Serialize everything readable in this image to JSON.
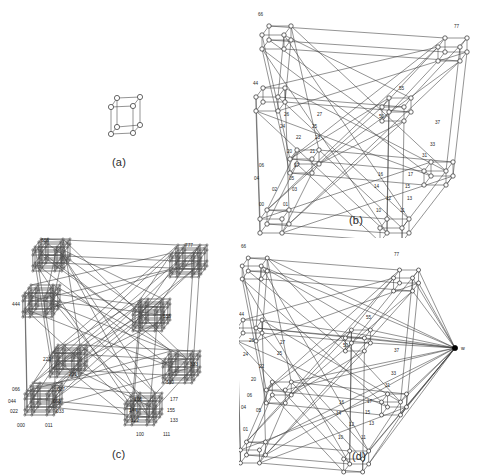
{
  "figure": {
    "kind": "multi-panel-line-drawing",
    "panel_count": 4,
    "background": "#ffffff",
    "ink": "#2a2a2a"
  },
  "captions": {
    "a": "(a)",
    "b": "(b)",
    "c": "(c)",
    "d": "(d)"
  },
  "panels": {
    "a": {
      "name": "panel-a",
      "description": "3-cube (Q3) drawn as a small box with 8 circular nodes",
      "node_count": 8,
      "labels": []
    },
    "b": {
      "name": "panel-b",
      "description": "Large recursive cube-of-cubes graph with 2-digit octal node labels",
      "node_count": 64,
      "labels": [
        "66",
        "77",
        "44",
        "55",
        "50",
        "37",
        "33",
        "31",
        "27",
        "26",
        "25",
        "24",
        "23",
        "22",
        "21",
        "20",
        "17",
        "16",
        "15",
        "14",
        "13",
        "12",
        "11",
        "10",
        "06",
        "05",
        "04",
        "03",
        "02",
        "01",
        "00",
        "07"
      ]
    },
    "c": {
      "name": "panel-c",
      "description": "Cube-of-cubes-of-cubes graph; each corner is a dense cluster, 3-digit octal labels",
      "cluster_count": 8,
      "labels": [
        "666",
        "777",
        "444",
        "555",
        "222",
        "333",
        "066",
        "027",
        "044",
        "055",
        "022",
        "033",
        "000",
        "011",
        "166",
        "177",
        "144",
        "155",
        "122",
        "133",
        "100",
        "111",
        "266",
        "377"
      ]
    },
    "d": {
      "name": "panel-d",
      "description": "Same as panel (b) but with an extra filled apex vertex w joined to many nodes",
      "labels": [
        "66",
        "77",
        "44",
        "55",
        "50",
        "37",
        "33",
        "31",
        "27",
        "26",
        "25",
        "24",
        "22",
        "20",
        "17",
        "16",
        "15",
        "14",
        "13",
        "12",
        "11",
        "10",
        "06",
        "04",
        "03",
        "02",
        "01",
        "00"
      ],
      "apex_label": "w"
    }
  },
  "node_labels": {
    "b": [
      {
        "t": "66",
        "x": 19,
        "y": 16
      },
      {
        "t": "77",
        "x": 215,
        "y": 28
      },
      {
        "t": "44",
        "x": 14,
        "y": 85
      },
      {
        "t": "55",
        "x": 160,
        "y": 90
      },
      {
        "t": "50",
        "x": 140,
        "y": 118
      },
      {
        "t": "37",
        "x": 196,
        "y": 124
      },
      {
        "t": "33",
        "x": 191,
        "y": 146
      },
      {
        "t": "31",
        "x": 183,
        "y": 157
      },
      {
        "t": "26",
        "x": 45,
        "y": 116
      },
      {
        "t": "27",
        "x": 78,
        "y": 116
      },
      {
        "t": "24",
        "x": 41,
        "y": 128
      },
      {
        "t": "25",
        "x": 73,
        "y": 128
      },
      {
        "t": "22",
        "x": 57,
        "y": 139
      },
      {
        "t": "23",
        "x": 76,
        "y": 139
      },
      {
        "t": "20",
        "x": 48,
        "y": 153
      },
      {
        "t": "21",
        "x": 71,
        "y": 153
      },
      {
        "t": "16",
        "x": 139,
        "y": 176
      },
      {
        "t": "17",
        "x": 169,
        "y": 176
      },
      {
        "t": "14",
        "x": 135,
        "y": 188
      },
      {
        "t": "15",
        "x": 166,
        "y": 188
      },
      {
        "t": "12",
        "x": 147,
        "y": 200
      },
      {
        "t": "13",
        "x": 168,
        "y": 200
      },
      {
        "t": "10",
        "x": 137,
        "y": 212
      },
      {
        "t": "11",
        "x": 161,
        "y": 212
      },
      {
        "t": "06",
        "x": 20,
        "y": 167
      },
      {
        "t": "07",
        "x": 55,
        "y": 167
      },
      {
        "t": "04",
        "x": 15,
        "y": 180
      },
      {
        "t": "05",
        "x": 50,
        "y": 180
      },
      {
        "t": "02",
        "x": 33,
        "y": 191
      },
      {
        "t": "03",
        "x": 53,
        "y": 191
      },
      {
        "t": "00",
        "x": 20,
        "y": 206
      },
      {
        "t": "01",
        "x": 44,
        "y": 206
      }
    ],
    "c": [
      {
        "t": "666",
        "x": 41,
        "y": 12
      },
      {
        "t": "777",
        "x": 185,
        "y": 17
      },
      {
        "t": "444",
        "x": 12,
        "y": 76
      },
      {
        "t": "555",
        "x": 163,
        "y": 88
      },
      {
        "t": "222",
        "x": 43,
        "y": 131
      },
      {
        "t": "221",
        "x": 69,
        "y": 146
      },
      {
        "t": "333",
        "x": 190,
        "y": 136
      },
      {
        "t": "330",
        "x": 166,
        "y": 154
      },
      {
        "t": "066",
        "x": 12,
        "y": 161
      },
      {
        "t": "027",
        "x": 57,
        "y": 161
      },
      {
        "t": "044",
        "x": 8,
        "y": 173
      },
      {
        "t": "055",
        "x": 53,
        "y": 173
      },
      {
        "t": "022",
        "x": 10,
        "y": 183
      },
      {
        "t": "033",
        "x": 56,
        "y": 183
      },
      {
        "t": "000",
        "x": 17,
        "y": 197
      },
      {
        "t": "011",
        "x": 45,
        "y": 197
      },
      {
        "t": "166",
        "x": 134,
        "y": 171
      },
      {
        "t": "177",
        "x": 170,
        "y": 171
      },
      {
        "t": "144",
        "x": 129,
        "y": 182
      },
      {
        "t": "155",
        "x": 167,
        "y": 182
      },
      {
        "t": "122",
        "x": 131,
        "y": 192
      },
      {
        "t": "133",
        "x": 170,
        "y": 192
      },
      {
        "t": "100",
        "x": 136,
        "y": 206
      },
      {
        "t": "111",
        "x": 163,
        "y": 206
      }
    ],
    "d": [
      {
        "t": "66",
        "x": 2,
        "y": 18
      },
      {
        "t": "77",
        "x": 155,
        "y": 26
      },
      {
        "t": "44",
        "x": 0,
        "y": 86
      },
      {
        "t": "55",
        "x": 127,
        "y": 89
      },
      {
        "t": "50",
        "x": 104,
        "y": 117
      },
      {
        "t": "37",
        "x": 155,
        "y": 122
      },
      {
        "t": "33",
        "x": 152,
        "y": 145
      },
      {
        "t": "31",
        "x": 146,
        "y": 157
      },
      {
        "t": "26",
        "x": 10,
        "y": 112
      },
      {
        "t": "27",
        "x": 41,
        "y": 114
      },
      {
        "t": "24",
        "x": 4,
        "y": 126
      },
      {
        "t": "25",
        "x": 38,
        "y": 125
      },
      {
        "t": "22",
        "x": 20,
        "y": 138
      },
      {
        "t": "20",
        "x": 12,
        "y": 151
      },
      {
        "t": "16",
        "x": 100,
        "y": 174
      },
      {
        "t": "17",
        "x": 128,
        "y": 173
      },
      {
        "t": "14",
        "x": 97,
        "y": 185
      },
      {
        "t": "15",
        "x": 126,
        "y": 184
      },
      {
        "t": "12",
        "x": 110,
        "y": 196
      },
      {
        "t": "13",
        "x": 130,
        "y": 195
      },
      {
        "t": "10",
        "x": 99,
        "y": 209
      },
      {
        "t": "11",
        "x": 122,
        "y": 209
      },
      {
        "t": "06",
        "x": 8,
        "y": 167
      },
      {
        "t": "04",
        "x": 2,
        "y": 179
      },
      {
        "t": "05",
        "x": 17,
        "y": 182
      },
      {
        "t": "01",
        "x": 4,
        "y": 201
      }
    ],
    "d_apex": {
      "t": "w",
      "x": 222,
      "y": 120
    }
  }
}
